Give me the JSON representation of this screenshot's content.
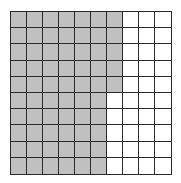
{
  "diagram": {
    "type": "hundred-grid",
    "rows": 10,
    "cols": 10,
    "shaded_per_row": [
      7,
      7,
      7,
      7,
      7,
      6,
      6,
      6,
      6,
      6
    ],
    "shaded_total": 65,
    "total_cells": 100,
    "colors": {
      "shaded": "#c0c0c0",
      "unshaded": "#ffffff",
      "line": "#2a2a2a"
    }
  }
}
